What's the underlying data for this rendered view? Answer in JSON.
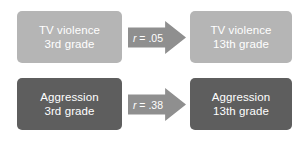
{
  "diagram": {
    "type": "path-diagram",
    "background_color": "#ffffff",
    "nodes": [
      {
        "id": "tv-violence-3rd",
        "line1": "TV violence",
        "line2": "3rd grade",
        "color": "#b5b5b5",
        "text_color": "#ffffff",
        "row": "top",
        "column": "left"
      },
      {
        "id": "tv-violence-13th",
        "line1": "TV violence",
        "line2": "13th grade",
        "color": "#b5b5b5",
        "text_color": "#ffffff",
        "row": "top",
        "column": "right"
      },
      {
        "id": "aggression-3rd",
        "line1": "Aggression",
        "line2": "3rd grade",
        "color": "#5e5e5e",
        "text_color": "#ffffff",
        "row": "bottom",
        "column": "left"
      },
      {
        "id": "aggression-13th",
        "line1": "Aggression",
        "line2": "13th grade",
        "color": "#5e5e5e",
        "text_color": "#ffffff",
        "row": "bottom",
        "column": "right"
      }
    ],
    "arrows": [
      {
        "id": "arrow-tv-violence",
        "from": "tv-violence-3rd",
        "to": "tv-violence-13th",
        "symbol": "r",
        "equals": " = ",
        "value": ".05",
        "label": "r = .05",
        "color": "#8f8f8f",
        "text_color": "#ffffff",
        "direction": "right"
      },
      {
        "id": "arrow-aggression",
        "from": "aggression-3rd",
        "to": "aggression-13th",
        "symbol": "r",
        "equals": " = ",
        "value": ".38",
        "label": "r = .38",
        "color": "#8f8f8f",
        "text_color": "#ffffff",
        "direction": "right"
      }
    ]
  }
}
